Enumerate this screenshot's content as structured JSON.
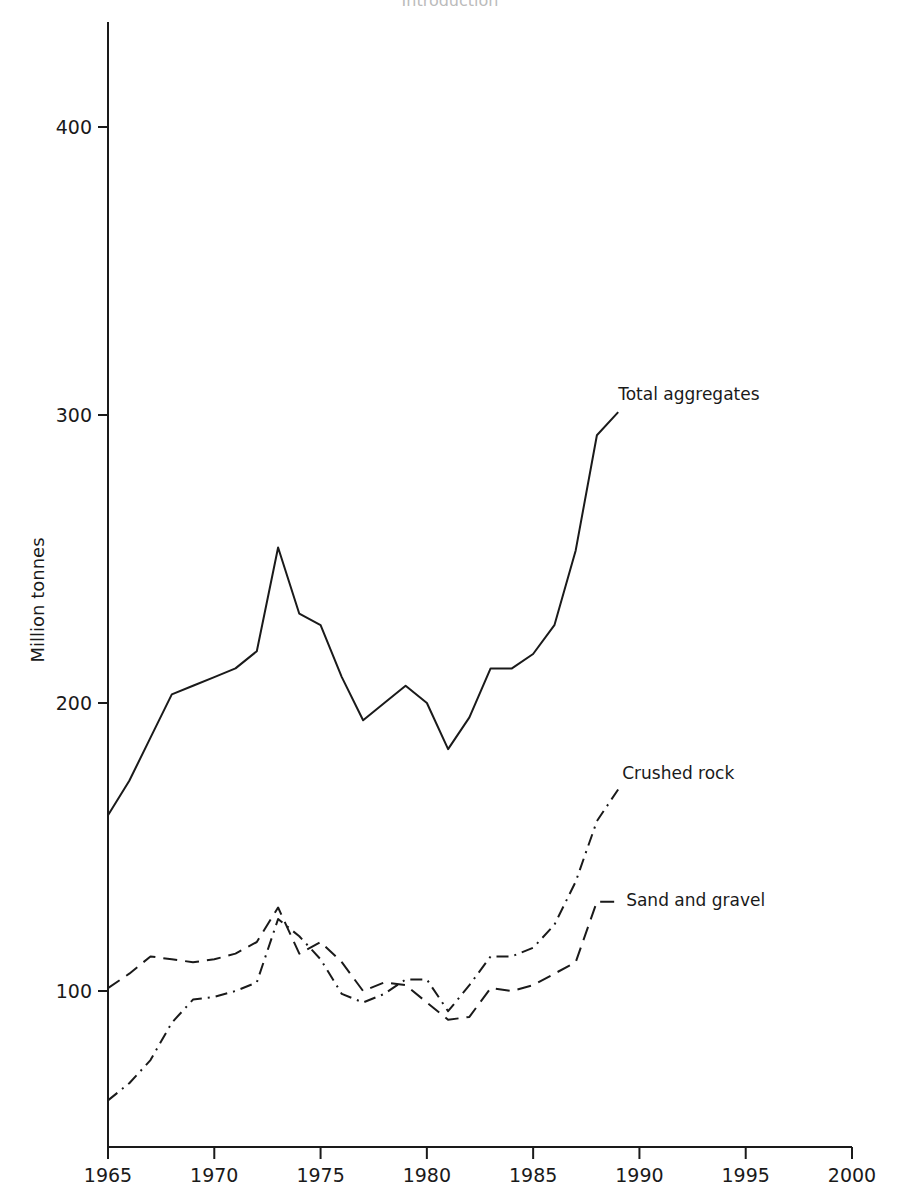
{
  "page": {
    "header_fragment": "Introduction"
  },
  "chart_data": {
    "type": "line",
    "title": "",
    "xlabel": "",
    "ylabel": "Million tonnes",
    "xlim": [
      1965,
      2000
    ],
    "ylim": [
      46,
      436
    ],
    "grid": false,
    "legend_position": "inline labels at line ends",
    "x_ticks": [
      1965,
      1970,
      1975,
      1980,
      1985,
      1990,
      1995,
      2000
    ],
    "y_ticks": [
      100,
      200,
      300,
      400
    ],
    "x": [
      1965,
      1966,
      1967,
      1968,
      1969,
      1970,
      1971,
      1972,
      1973,
      1974,
      1975,
      1976,
      1977,
      1978,
      1979,
      1980,
      1981,
      1982,
      1983,
      1984,
      1985,
      1986,
      1987,
      1988
    ],
    "series": [
      {
        "name": "Total aggregates",
        "style": "solid",
        "values": [
          161,
          173,
          188,
          203,
          206,
          209,
          212,
          218,
          254,
          231,
          227,
          209,
          194,
          200,
          206,
          200,
          184,
          195,
          212,
          212,
          217,
          227,
          253,
          293
        ],
        "label_leader_end": {
          "x": 1989,
          "y": 301
        }
      },
      {
        "name": "Crushed rock",
        "style": "dash-dot",
        "values": [
          62,
          68,
          76,
          89,
          97,
          98,
          100,
          103,
          125,
          119,
          111,
          99,
          96,
          99,
          104,
          104,
          93,
          102,
          112,
          112,
          115,
          123,
          138,
          159
        ],
        "label_leader_end": {
          "x": 1989,
          "y": 170
        }
      },
      {
        "name": "Sand and gravel",
        "style": "dashed",
        "values": [
          101,
          106,
          112,
          111,
          110,
          111,
          113,
          117,
          129,
          113,
          117,
          110,
          100,
          103,
          102,
          96,
          90,
          91,
          101,
          100,
          102,
          106,
          110,
          131
        ],
        "label_leader_end": {
          "x": 1989,
          "y": 131
        }
      }
    ]
  }
}
